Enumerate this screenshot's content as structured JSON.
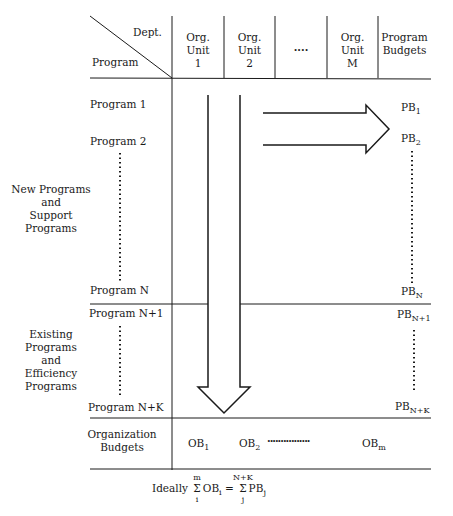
{
  "header": {
    "corner_top": "Dept.",
    "corner_bottom": "Program",
    "columns": [
      {
        "line1": "Org.",
        "line2": "Unit",
        "line3": "1"
      },
      {
        "line1": "Org.",
        "line2": "Unit",
        "line3": "2"
      },
      {
        "line1": "····",
        "line2": "",
        "line3": ""
      },
      {
        "line1": "Org.",
        "line2": "Unit",
        "line3": "M"
      },
      {
        "line1": "Program",
        "line2": "Budgets",
        "line3": ""
      }
    ]
  },
  "groups": {
    "new": {
      "line1": "New Programs",
      "line2": "and",
      "line3": "Support",
      "line4": "Programs"
    },
    "existing": {
      "line1": "Existing",
      "line2": "Programs",
      "line3": "and",
      "line4": "Efficiency",
      "line5": "Programs"
    }
  },
  "programs": {
    "p1": "Program 1",
    "p2": "Program 2",
    "pn": "Program N",
    "pn1": "Program N+1",
    "pnk": "Program N+K"
  },
  "program_budgets": {
    "pb1": {
      "base": "PB",
      "sub": "1"
    },
    "pb2": {
      "base": "PB",
      "sub": "2"
    },
    "pbn": {
      "base": "PB",
      "sub": "N"
    },
    "pbn1": {
      "base": "PB",
      "sub": "N+1"
    },
    "pbnk": {
      "base": "PB",
      "sub": "N+K"
    }
  },
  "org_budgets": {
    "label_line1": "Organization",
    "label_line2": "Budgets",
    "ob1": {
      "base": "OB",
      "sub": "1"
    },
    "ob2": {
      "base": "OB",
      "sub": "2"
    },
    "dots": "················",
    "obm": {
      "base": "OB",
      "sub": "m"
    }
  },
  "formula": {
    "prefix": "Ideally",
    "sum1_top": "m",
    "sum1_bottom": "i",
    "sigma": "Σ",
    "term1": "OB",
    "term1_sub": "i",
    "equals": "=",
    "sum2_top": "N+K",
    "sum2_bottom": "j",
    "term2": "PB",
    "term2_sub": "j"
  }
}
